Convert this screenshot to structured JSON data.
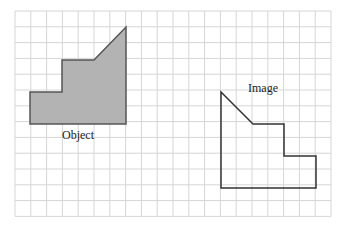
{
  "diagram": {
    "type": "grid-transformation",
    "grid": {
      "x0": 15,
      "y0": 11,
      "cols": 20,
      "rows": 13,
      "cell": 15.8,
      "color": "#d6d6d6"
    },
    "object": {
      "label": "Object",
      "fill": "#b3b3b3",
      "stroke": "#555555",
      "points": "30,124 30,92 62,92 62,60 94,60 126,27 126,124"
    },
    "image": {
      "label": "Image",
      "fill": "none",
      "stroke": "#333333",
      "points": "221,92 253,124 284,124 284,156 316,156 316,188 221,188"
    }
  }
}
